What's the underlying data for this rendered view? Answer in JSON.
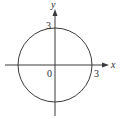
{
  "diagram": {
    "type": "circle-on-cartesian-axes",
    "equation_implied": "x^2 + y^2 = 9",
    "circle": {
      "center": [
        0,
        0
      ],
      "radius": 3
    },
    "axes": {
      "x_label": "x",
      "y_label": "y"
    },
    "labels": {
      "origin": "0",
      "y_intercept": "3",
      "x_intercept": "3"
    },
    "colors": {
      "stroke": "#3a3a3a",
      "text": "#2a2a2a",
      "background": "#ffffff"
    }
  }
}
